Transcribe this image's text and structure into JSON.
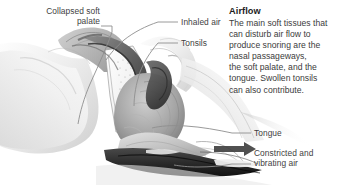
{
  "figure": {
    "kind": "anatomical-cross-section",
    "palette": {
      "background": "#ffffff",
      "ink": "#3f3f3f",
      "heading_ink": "#1d1d1d",
      "leader_line": "#8a8a8a",
      "tissue_light": "#e9e9e9",
      "tissue_mid": "#bdbdbd",
      "tissue_dark": "#6f6f6f",
      "airway_dark": "#4a4a4a",
      "airway_darkest": "#2e2e2e",
      "bone_white": "#f7f7f7"
    }
  },
  "callouts": [
    {
      "id": "collapsed-soft-palate",
      "label": "Collapsed soft\npalate",
      "align": "right",
      "text_x": 4,
      "text_y": 6,
      "text_w": 96
    },
    {
      "id": "inhaled-air",
      "label": "Inhaled air",
      "align": "left",
      "text_x": 181,
      "text_y": 17,
      "text_w": 60
    },
    {
      "id": "tonsils",
      "label": "Tonsils",
      "align": "left",
      "text_x": 181,
      "text_y": 39,
      "text_w": 60
    },
    {
      "id": "tongue",
      "label": "Tongue",
      "align": "left",
      "text_x": 254,
      "text_y": 128,
      "text_w": 70
    },
    {
      "id": "constricted-and-vibrating-air",
      "label": "Constricted and\nvibrating air",
      "align": "left",
      "text_x": 254,
      "text_y": 148,
      "text_w": 80
    }
  ],
  "panel": {
    "heading": "Airflow",
    "body": "The main soft tissues that\ncan disturb air flow to\nproduce snoring are the\nnasal passageways,\nthe soft palate, and the\ntongue. Swollen tonsils\ncan also contribute."
  }
}
